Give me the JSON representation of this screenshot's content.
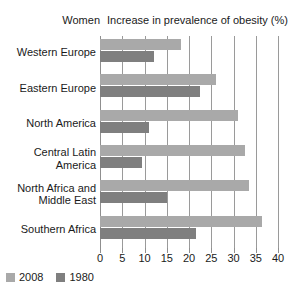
{
  "header": {
    "group_label": "Women",
    "title": "Increase in prevalence of obesity (%)"
  },
  "legend": {
    "items": [
      {
        "label": "2008",
        "color": "#a9a9a9"
      },
      {
        "label": "1980",
        "color": "#7f7f7f"
      }
    ]
  },
  "axis": {
    "ticks": [
      "0",
      "5",
      "10",
      "15",
      "20",
      "25",
      "30",
      "35",
      "40"
    ]
  },
  "chart_data": {
    "type": "bar",
    "title": "Increase in prevalence of obesity (%)",
    "subtitle": "Women",
    "orientation": "horizontal",
    "xlabel": "Increase in prevalence of obesity (%)",
    "ylabel": "",
    "xlim": [
      0,
      40
    ],
    "xticks": [
      0,
      5,
      10,
      15,
      20,
      25,
      30,
      35,
      40
    ],
    "grid": true,
    "legend_position": "bottom-left",
    "categories": [
      "Western Europe",
      "Eastern Europe",
      "North America",
      "Central Latin America",
      "North Africa and Middle East",
      "Southern Africa"
    ],
    "category_lines": [
      [
        "Western Europe"
      ],
      [
        "Eastern Europe"
      ],
      [
        "North America"
      ],
      [
        "Central Latin",
        "America"
      ],
      [
        "North Africa and",
        "Middle East"
      ],
      [
        "Southern Africa"
      ]
    ],
    "series": [
      {
        "name": "2008",
        "color": "#a9a9a9",
        "values": [
          18.2,
          26.0,
          31.0,
          32.5,
          33.5,
          36.5
        ]
      },
      {
        "name": "1980",
        "color": "#7f7f7f",
        "values": [
          12.1,
          22.5,
          11.0,
          9.5,
          15.0,
          21.5
        ]
      }
    ]
  }
}
